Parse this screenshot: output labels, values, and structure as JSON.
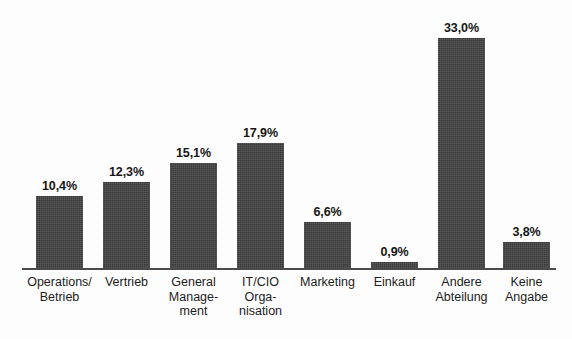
{
  "chart_data": {
    "type": "bar",
    "title": "",
    "subtitle": "",
    "xlabel": "",
    "ylabel": "",
    "ylim": [
      0,
      33
    ],
    "grid": false,
    "legend": null,
    "value_suffix": "%",
    "decimal_separator": ",",
    "bar_color": "#3a3a3a",
    "axis_color": "#4a4a4a",
    "background_color": "#fdfdfd",
    "categories": [
      "Operations/\nBetrieb",
      "Vertrieb",
      "General\nManage-\nment",
      "IT/CIO\nOrga-\nnisation",
      "Marketing",
      "Einkauf",
      "Andere\nAbteilung",
      "Keine\nAngabe"
    ],
    "values": [
      10.4,
      12.3,
      15.1,
      17.9,
      6.6,
      0.9,
      33.0,
      3.8
    ],
    "value_labels": [
      "10,4%",
      "12,3%",
      "15,1%",
      "17,9%",
      "6,6%",
      "0,9%",
      "33,0%",
      "3,8%"
    ]
  }
}
